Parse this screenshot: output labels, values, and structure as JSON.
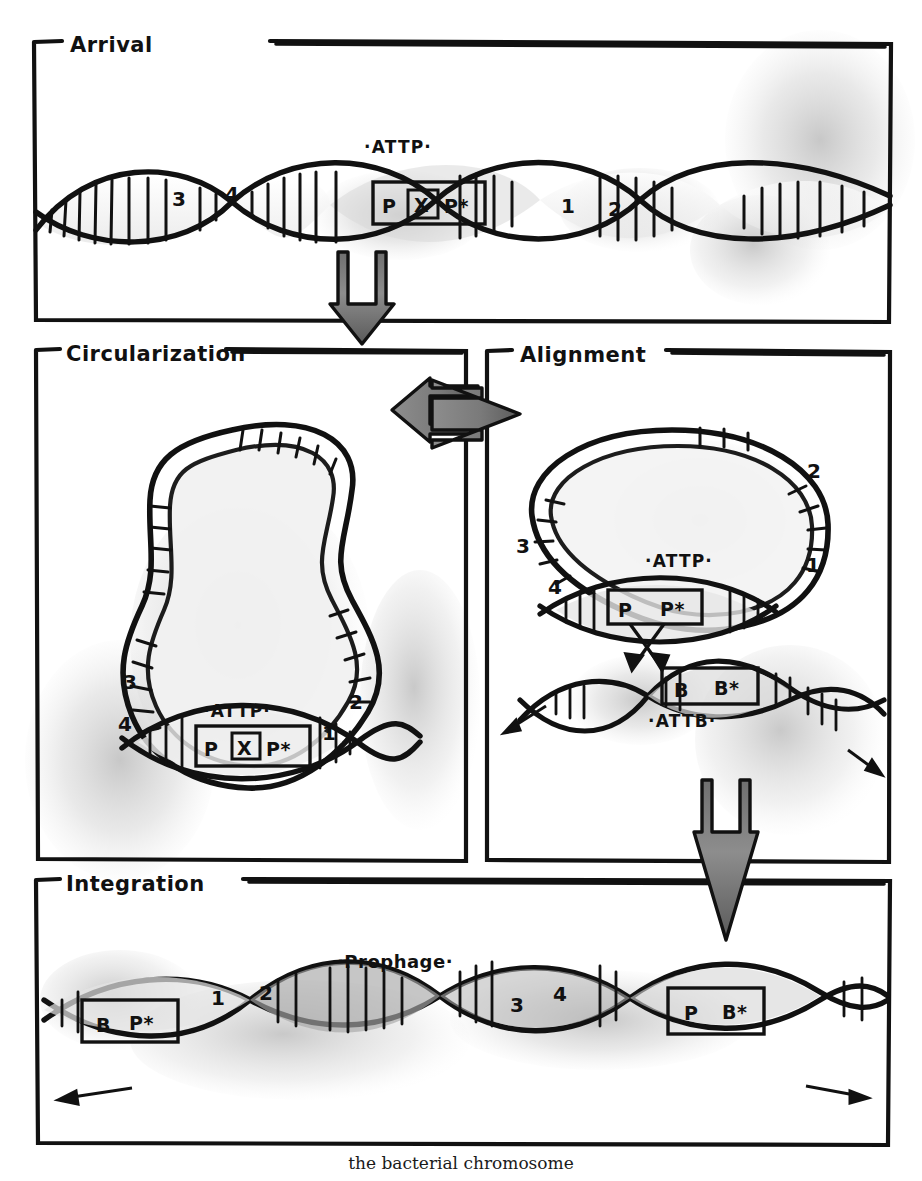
{
  "figure": {
    "background_color": "#ffffff",
    "ink_color": "#111111",
    "wash_color": "#b9b9b9"
  },
  "panels": [
    {
      "id": "arrival",
      "title": "Arrival",
      "site_label": "·ATTP·",
      "box": {
        "left": "P",
        "middle": "X",
        "right": "P*"
      },
      "tick_numbers": [
        "3",
        "4",
        "1",
        "2"
      ]
    },
    {
      "id": "circularization",
      "title": "Circularization",
      "site_label": "·ATTP·",
      "box": {
        "left": "P",
        "middle": "X",
        "right": "P*"
      },
      "tick_numbers": [
        "3",
        "4",
        "1",
        "2"
      ]
    },
    {
      "id": "alignment",
      "title": "Alignment",
      "phage_site_label": "·ATTP·",
      "phage_box": {
        "left": "P",
        "right": "P*"
      },
      "host_site_label": "·ATTB·",
      "host_box": {
        "left": "B",
        "right": "B*"
      },
      "tick_numbers": [
        "3",
        "4",
        "1",
        "2"
      ]
    },
    {
      "id": "integration",
      "title": "Integration",
      "prophage_label": "·Prophage·",
      "left_box": {
        "left": "B",
        "right": "P*"
      },
      "right_box": {
        "left": "P",
        "right": "B*"
      },
      "tick_numbers": [
        "1",
        "2",
        "3",
        "4"
      ]
    }
  ],
  "flow_arrows": [
    {
      "id": "arrival-to-circularization",
      "direction": "down"
    },
    {
      "id": "circularization-to-alignment",
      "direction": "right"
    },
    {
      "id": "alignment-to-integration",
      "direction": "down"
    }
  ],
  "caption": "the bacterial chromosome"
}
